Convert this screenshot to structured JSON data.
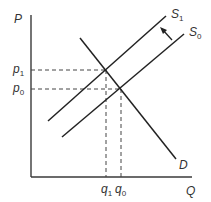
{
  "diagram": {
    "type": "supply-demand",
    "axes": {
      "y_label": "P",
      "x_label": "Q"
    },
    "price_labels": {
      "p1": "p",
      "p1_sub": "1",
      "p0": "p",
      "p0_sub": "0"
    },
    "quantity_labels": {
      "q1": "q",
      "q1_sub": "1",
      "q0": "q",
      "q0_sub": "0"
    },
    "curves": {
      "s1": {
        "label": "S",
        "sub": "1"
      },
      "s0": {
        "label": "S",
        "sub": "0"
      },
      "d": {
        "label": "D"
      }
    },
    "shift_arrow": "S0 to S1 (supply decrease, leftward/upward shift)"
  }
}
